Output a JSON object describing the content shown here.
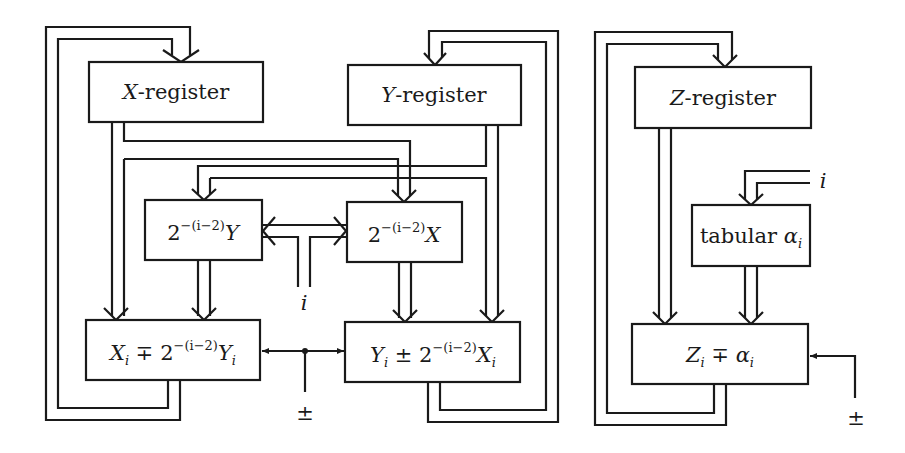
{
  "diagram": {
    "title": "",
    "colors": {
      "stroke": "#1a1a1a",
      "background": "#ffffff"
    },
    "blocks": {
      "x_register": {
        "var": "X",
        "suffix": "-register"
      },
      "y_register": {
        "var": "Y",
        "suffix": "-register"
      },
      "z_register": {
        "var": "Z",
        "suffix": "-register"
      },
      "shift_y": {
        "base": "2",
        "exp": "−(i−2)",
        "var": "Y"
      },
      "shift_x": {
        "base": "2",
        "exp": "−(i−2)",
        "var": "X"
      },
      "x_update": {
        "lhs": "X",
        "lhs_sub": "i",
        "op": " ∓ ",
        "base": "2",
        "exp": "−(i−2)",
        "rhs": "Y",
        "rhs_sub": "i"
      },
      "y_update": {
        "lhs": "Y",
        "lhs_sub": "i",
        "op": " ± ",
        "base": "2",
        "exp": "−(i−2)",
        "rhs": "X",
        "rhs_sub": "i"
      },
      "tabular_alpha": {
        "text": "tabular ",
        "var": "α",
        "sub": "i"
      },
      "z_update": {
        "lhs": "Z",
        "lhs_sub": "i",
        "op": " ∓ ",
        "rhs": "α",
        "rhs_sub": "i"
      }
    },
    "inputs": {
      "i_shift": "i",
      "i_table": "i",
      "sign_xy": "±",
      "sign_z": "±"
    },
    "edges": [
      {
        "from": "x_register",
        "to": "x_update"
      },
      {
        "from": "x_register",
        "to": "shift_x"
      },
      {
        "from": "y_register",
        "to": "shift_y"
      },
      {
        "from": "y_register",
        "to": "y_update"
      },
      {
        "from": "shift_y",
        "to": "x_update"
      },
      {
        "from": "shift_x",
        "to": "y_update"
      },
      {
        "from": "i_shift",
        "to": "shift_y"
      },
      {
        "from": "i_shift",
        "to": "shift_x"
      },
      {
        "from": "sign_xy",
        "to": "x_update"
      },
      {
        "from": "sign_xy",
        "to": "y_update"
      },
      {
        "from": "x_update",
        "to": "x_register"
      },
      {
        "from": "y_update",
        "to": "y_register"
      },
      {
        "from": "z_register",
        "to": "z_update"
      },
      {
        "from": "i_table",
        "to": "tabular_alpha"
      },
      {
        "from": "tabular_alpha",
        "to": "z_update"
      },
      {
        "from": "sign_z",
        "to": "z_update"
      },
      {
        "from": "z_update",
        "to": "z_register"
      }
    ]
  }
}
